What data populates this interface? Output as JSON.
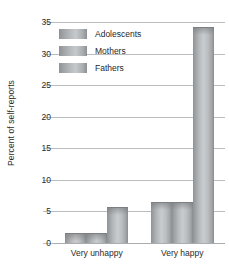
{
  "chart_data": {
    "type": "bar",
    "title": "",
    "xlabel": "",
    "ylabel": "Percent of self-reports",
    "categories": [
      "Very unhappy",
      "Very happy"
    ],
    "series": [
      {
        "name": "Adolescents",
        "values": [
          1.5,
          6.3
        ]
      },
      {
        "name": "Mothers",
        "values": [
          1.5,
          6.3
        ]
      },
      {
        "name": "Fathers",
        "values": [
          5.5,
          34.0
        ]
      }
    ],
    "ylim": [
      0,
      35
    ],
    "yticks": [
      0,
      5,
      10,
      15,
      20,
      25,
      30,
      35
    ],
    "ytick_labels": [
      "0",
      "5",
      "10",
      "15",
      "20",
      "25",
      "30",
      "35"
    ],
    "grid": true,
    "legend_position": "top-left-inside",
    "colors": {
      "bar_light": "#c9cccf",
      "bar_dark": "#8a8d90",
      "gridline": "#b9bdc0",
      "text": "#2b2b2b",
      "background": "#ffffff"
    }
  }
}
